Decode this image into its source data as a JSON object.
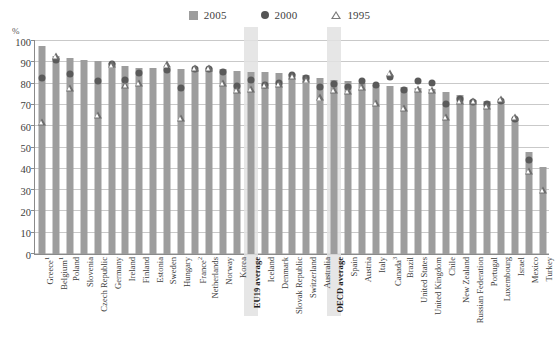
{
  "legend": {
    "items": [
      {
        "label": "2005",
        "marker": "square-icon",
        "color": "#9d9d9d"
      },
      {
        "label": "2000",
        "marker": "circle-icon",
        "color": "#5a5a5a"
      },
      {
        "label": "1995",
        "marker": "triangle-icon",
        "color": "#6e6e6e"
      }
    ]
  },
  "axis": {
    "unit_label": "%",
    "yticks": [
      "0",
      "10",
      "20",
      "30",
      "40",
      "50",
      "60",
      "70",
      "80",
      "90",
      "100"
    ]
  },
  "chart_data": {
    "type": "bar",
    "title": "",
    "xlabel": "",
    "ylabel": "%",
    "ylim": [
      0,
      100
    ],
    "ytick_step": 10,
    "grid": true,
    "legend_position": "top-center",
    "highlighted_categories": [
      "EU19 average",
      "OECD average"
    ],
    "categories": [
      "Greece¹",
      "Belgium¹",
      "Poland",
      "Slovenia",
      "Czech Republic",
      "Germany",
      "Ireland",
      "Finland",
      "Estonia",
      "Sweden",
      "Hungary",
      "France²",
      "Netherlands",
      "Norway",
      "Korea",
      "EU19 average",
      "Iceland",
      "Denmark",
      "Slovak Republic",
      "Switzerland",
      "Australia",
      "OECD average",
      "Spain",
      "Austria",
      "Italy",
      "Canada³",
      "Brazil",
      "United States",
      "United Kingdom",
      "Chile",
      "New Zealand",
      "Russian Federation",
      "Portugal",
      "Luxembourg",
      "Israel",
      "Mexico",
      "Turkey"
    ],
    "series": [
      {
        "name": "2005",
        "marker": "square-icon",
        "color": "#9d9d9d",
        "values": [
          97.5,
          93,
          92,
          91,
          90.5,
          89.5,
          88.5,
          87.5,
          87.5,
          87.5,
          87,
          86.5,
          87.5,
          87,
          86,
          85.5,
          85.5,
          85,
          84.5,
          84,
          82.5,
          81.5,
          81,
          80.5,
          79.5,
          79,
          78.5,
          78,
          77.5,
          76,
          74.5,
          72.5,
          72,
          71.5,
          64,
          48,
          41
        ]
      },
      {
        "name": "2000",
        "marker": "circle-icon",
        "color": "#5a5a5a",
        "values": [
          82.5,
          91,
          84.5,
          null,
          81,
          89,
          81.5,
          85,
          null,
          86.5,
          78,
          87,
          87,
          85.5,
          79,
          81.5,
          79.5,
          80.5,
          84,
          82.5,
          78.5,
          80,
          78.5,
          81,
          79.5,
          83,
          77,
          81,
          80.5,
          70.5,
          73,
          71.5,
          70.5,
          72,
          63.5,
          44,
          null
        ]
      },
      {
        "name": "1995",
        "marker": "triangle-icon",
        "color": "#6e6e6e",
        "values": [
          62,
          93,
          78,
          null,
          65.5,
          89,
          79.5,
          80.5,
          null,
          89,
          64,
          87.5,
          87.5,
          80.5,
          77,
          77.5,
          79.5,
          80,
          83.5,
          82,
          73.5,
          77,
          76.5,
          78.5,
          71,
          85,
          68.5,
          77.5,
          77,
          64.5,
          72,
          72,
          69.5,
          73,
          64.5,
          39,
          30
        ]
      }
    ]
  }
}
